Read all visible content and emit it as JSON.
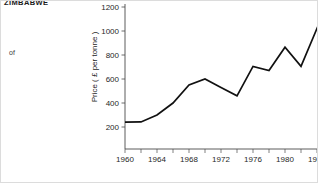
{
  "page": {
    "heading": "ZIMBABWE",
    "body_word": "of"
  },
  "chart_data": {
    "type": "line",
    "title": "",
    "xlabel": "",
    "ylabel": "Price ( £ per tonne )",
    "xlim": [
      1959,
      1986.5
    ],
    "ylim": [
      100,
      1250
    ],
    "grid": false,
    "legend": null,
    "y_ticks": [
      200,
      400,
      600,
      800,
      1000,
      1200
    ],
    "y_tick_labels": [
      "200",
      "400",
      "600",
      "800",
      "1000",
      "1200"
    ],
    "x_ticks": [
      1960,
      1962,
      1964,
      1966,
      1968,
      1970,
      1972,
      1974,
      1976,
      1978,
      1980,
      1982,
      1984,
      1986
    ],
    "x_tick_labels": [
      "1960",
      "",
      "1964",
      "",
      "1968",
      "",
      "1972",
      "",
      "1976",
      "",
      "1980",
      "",
      "1984",
      ""
    ],
    "x_labeled_ticks": [
      1960,
      1964,
      1968,
      1972,
      1976,
      1980,
      1984
    ],
    "x_labeled_text": [
      "1960",
      "1964",
      "1968",
      "1972",
      "1976",
      "1980",
      "1984"
    ],
    "series": [
      {
        "name": "Price",
        "x": [
          1960,
          1962,
          1964,
          1966,
          1968,
          1970,
          1972,
          1974,
          1976,
          1978,
          1980,
          1982,
          1985,
          1986
        ],
        "values": [
          240,
          242,
          300,
          400,
          550,
          600,
          530,
          460,
          705,
          670,
          865,
          705,
          1180,
          1030
        ],
        "color": "#111111"
      }
    ]
  }
}
